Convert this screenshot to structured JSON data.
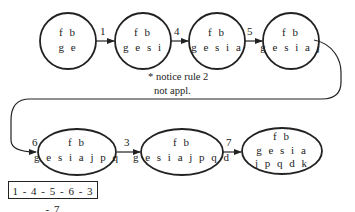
{
  "nodes": [
    {
      "id": "n1",
      "line1": "f b",
      "line2": "g e",
      "line3": ""
    },
    {
      "id": "n2",
      "line1": "f b",
      "line2": "g e s i",
      "line3": ""
    },
    {
      "id": "n3",
      "line1": "f b",
      "line2": "g e s i a",
      "line3": ""
    },
    {
      "id": "n4",
      "line1": "f b",
      "line2": "g e s i a j",
      "line3": ""
    },
    {
      "id": "n5",
      "line1": "f b",
      "line2": "g e s i a j p q",
      "line3": ""
    },
    {
      "id": "n6",
      "line1": "f b",
      "line2": "g e s i a j p q d",
      "line3": ""
    },
    {
      "id": "n7",
      "line1": "f b",
      "line2": "g e s i a",
      "line3": "j p q d k"
    }
  ],
  "edges": [
    {
      "from": "n1",
      "to": "n2",
      "label": "1"
    },
    {
      "from": "n2",
      "to": "n3",
      "label": "4"
    },
    {
      "from": "n3",
      "to": "n4",
      "label": "5"
    },
    {
      "from": "n4",
      "to": "n5",
      "label": "6"
    },
    {
      "from": "n5",
      "to": "n6",
      "label": "3"
    },
    {
      "from": "n6",
      "to": "n7",
      "label": "7"
    }
  ],
  "note": {
    "line1": "* notice rule 2",
    "line2": "not appl."
  },
  "sequence": "1 - 4 - 5 - 6 - 3 - 7"
}
